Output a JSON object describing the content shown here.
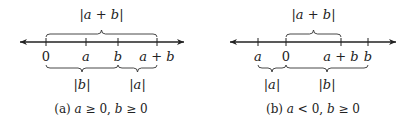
{
  "diagrams": [
    {
      "id": "a",
      "caption": "(a) a ≥ 0, b ≥ 0",
      "ticks": [
        {
          "label": "0",
          "italic": false
        },
        {
          "label": "a",
          "italic": true
        },
        {
          "label": "b",
          "italic": true
        },
        {
          "label": "a + b",
          "italic": true
        }
      ],
      "top_brace": {
        "from_tick": 0,
        "to_tick": 3,
        "label": "|a + b|"
      },
      "bottom_braces": [
        {
          "from_tick": 0,
          "to_tick": 2,
          "label": "|b|"
        },
        {
          "from_tick": 2,
          "to_tick": 3,
          "label": "|a|"
        }
      ]
    },
    {
      "id": "b",
      "caption": "(b) a < 0, b ≥ 0",
      "ticks": [
        {
          "label": "a",
          "italic": true
        },
        {
          "label": "0",
          "italic": false
        },
        {
          "label": "a + b",
          "italic": true
        },
        {
          "label": "b",
          "italic": true
        }
      ],
      "top_brace": {
        "from_tick": 1,
        "to_tick": 2,
        "label": "|a + b|"
      },
      "bottom_braces": [
        {
          "from_tick": 0,
          "to_tick": 1,
          "label": "|a|"
        },
        {
          "from_tick": 1,
          "to_tick": 3,
          "label": "|b|"
        }
      ]
    }
  ]
}
